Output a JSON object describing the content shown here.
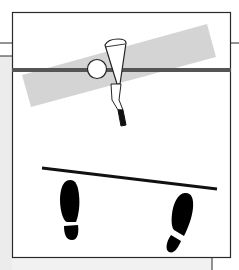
{
  "figure": {
    "colors": {
      "frame": "#2a2a2a",
      "target_bar": "#555555",
      "swing_band": "#d4d4d4",
      "alignment_line": "#111111",
      "footprints": "#000000",
      "background": "#ffffff",
      "side_panel": "#ececec"
    },
    "elements": {
      "ball": "golf-ball",
      "club": "iron-club",
      "band": "swing-plane-band",
      "bar": "target-line-bar",
      "line": "foot-alignment-line",
      "left_foot": "left-footprint",
      "right_foot": "right-footprint"
    }
  }
}
